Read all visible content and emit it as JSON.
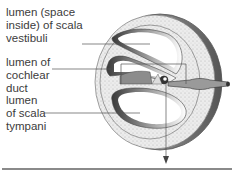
{
  "figure": {
    "labels": [
      {
        "id": "scala-vestibuli",
        "text": "lumen (space\ninside) of scala\nvestibuli"
      },
      {
        "id": "cochlear-duct",
        "text": "lumen of\ncochlear\nduct"
      },
      {
        "id": "scala-tympani",
        "text": "lumen\nof scala\ntympani"
      }
    ],
    "colors": {
      "bone_fill": "#e8e8e8",
      "bone_stipple": "#b0b0b0",
      "outer_dark": "#6a6a6a",
      "cavity_shade": "#4a4a4a",
      "line": "#555555"
    }
  }
}
